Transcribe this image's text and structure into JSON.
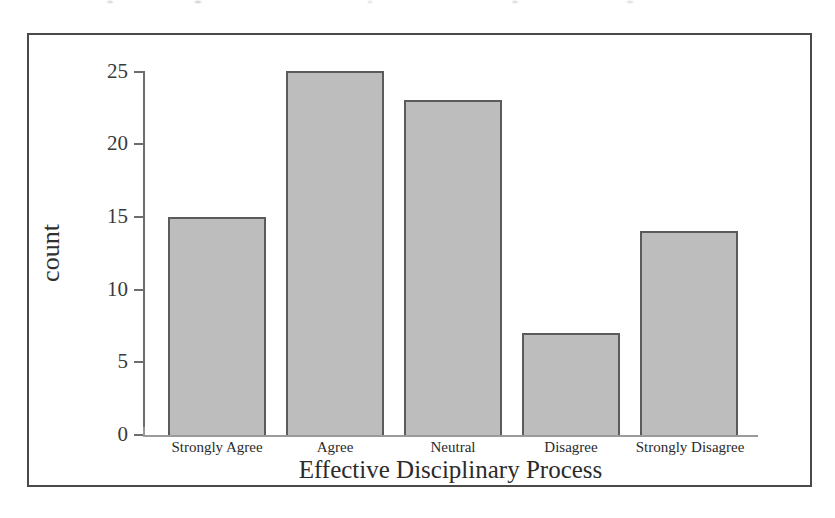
{
  "chart_data": {
    "type": "bar",
    "title": "",
    "xlabel": "Effective Disciplinary Process",
    "ylabel": "count",
    "categories": [
      "Strongly Agree",
      "Agree",
      "Neutral",
      "Disagree",
      "Strongly Disagree"
    ],
    "values": [
      15,
      25,
      23,
      7,
      14
    ],
    "ylim": [
      0,
      25
    ],
    "yticks": [
      0,
      5,
      10,
      15,
      20,
      25
    ],
    "ytick_labels": [
      "0",
      "5",
      "10",
      "15",
      "20",
      "25"
    ],
    "grid": false,
    "legend": null,
    "bar_fill_color": "#bdbdbd",
    "bar_edge_color": "#5b5b5b",
    "axis_color": "#6d6d6d",
    "frame_color": "#4a4a4a",
    "text_color": "#2b2b2b"
  }
}
